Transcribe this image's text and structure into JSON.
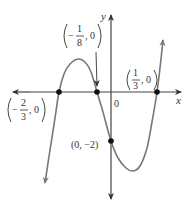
{
  "figure": {
    "type": "cubic-function-graph",
    "function": "f(x) = 72(x + 2/3)(x + 1/8)(x - 1/3)",
    "axes": {
      "x_label": "x",
      "y_label": "y",
      "origin_label": "0"
    },
    "points": [
      {
        "id": "root-neg-two-thirds",
        "x": -0.6667,
        "y": 0,
        "sign": "−",
        "num": "2",
        "den": "3",
        "tail": ", 0"
      },
      {
        "id": "root-neg-one-eighth",
        "x": -0.125,
        "y": 0,
        "sign": "−",
        "num": "1",
        "den": "8",
        "tail": ", 0"
      },
      {
        "id": "root-one-third",
        "x": 0.3333,
        "y": 0,
        "sign": "",
        "num": "1",
        "den": "3",
        "tail": ", 0"
      },
      {
        "id": "y-intercept",
        "x": 0,
        "y": -2,
        "label": "(0, −2)"
      }
    ],
    "colors": {
      "curve": "#777777",
      "axes": "#444444",
      "points": "#111111",
      "text": "#333333"
    }
  }
}
